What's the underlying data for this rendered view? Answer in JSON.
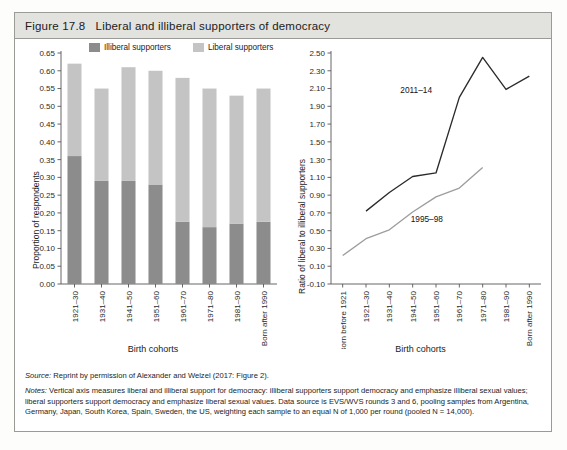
{
  "figure": {
    "number": "Figure 17.8",
    "title": "Liberal and illiberal supporters of democracy"
  },
  "colors": {
    "illiberal": "#8c8c8c",
    "liberal": "#c4c4c4",
    "line_2011_14": "#2b2b2b",
    "line_1995_98": "#9d9d9d",
    "axis": "#555555",
    "caption_bar": "#e2e2de",
    "border": "#9a9a96"
  },
  "legend": {
    "items": [
      {
        "label": "Illiberal supporters",
        "color": "#8c8c8c"
      },
      {
        "label": "Liberal supporters",
        "color": "#c4c4c4"
      }
    ]
  },
  "chart_data": [
    {
      "type": "bar",
      "id": "left-panel",
      "title": "",
      "xlabel": "Birth cohorts",
      "ylabel": "Proportion of respondents",
      "stacked": true,
      "ylim": [
        0.0,
        0.65
      ],
      "ytick_step": 0.05,
      "ytick_labels": [
        "0.00",
        "0.05",
        "0.10",
        "0.15",
        "0.20",
        "0.25",
        "0.30",
        "0.35",
        "0.40",
        "0.45",
        "0.50",
        "0.55",
        "0.60",
        "0.65"
      ],
      "grid": false,
      "legend_position": "top",
      "categories": [
        "1921–30",
        "1931–40",
        "1941–50",
        "1951–60",
        "1961–70",
        "1971–80",
        "1981–90",
        "Born after 1990"
      ],
      "series": [
        {
          "name": "Illiberal supporters",
          "color": "#8c8c8c",
          "values": [
            0.36,
            0.29,
            0.29,
            0.28,
            0.175,
            0.16,
            0.17,
            0.175
          ]
        },
        {
          "name": "Liberal supporters",
          "color": "#c4c4c4",
          "values": [
            0.26,
            0.26,
            0.32,
            0.32,
            0.405,
            0.39,
            0.36,
            0.375
          ]
        }
      ],
      "totals": [
        0.62,
        0.55,
        0.61,
        0.6,
        0.58,
        0.55,
        0.53,
        0.55
      ]
    },
    {
      "type": "line",
      "id": "right-panel",
      "title": "",
      "xlabel": "Birth cohorts",
      "ylabel": "Ratio of liberal to illiberal supporters",
      "ylim": [
        -0.1,
        2.5
      ],
      "ytick_step": 0.2,
      "ytick_labels": [
        "-0.10",
        "0.10",
        "0.30",
        "0.50",
        "0.70",
        "0.90",
        "1.10",
        "1.30",
        "1.50",
        "1.70",
        "1.90",
        "2.10",
        "2.30",
        "2.50"
      ],
      "grid": false,
      "legend_position": "inline-annotation",
      "categories": [
        "Born before 1921",
        "1921–30",
        "1931–40",
        "1941–50",
        "1951–60",
        "1961–70",
        "1971–80",
        "1981–90",
        "Born after 1990"
      ],
      "series": [
        {
          "name": "2011–14",
          "color": "#2b2b2b",
          "annotation": "2011–14",
          "x": [
            "1921–30",
            "1931–40",
            "1941–50",
            "1951–60",
            "1961–70",
            "1971–80",
            "1981–90"
          ],
          "values": [
            0.72,
            0.93,
            1.11,
            1.15,
            2.0,
            2.45,
            2.09
          ],
          "values_full": [
            null,
            0.72,
            0.93,
            1.11,
            1.15,
            2.0,
            2.45,
            2.09,
            2.24
          ]
        },
        {
          "name": "1995–98",
          "color": "#9d9d9d",
          "annotation": "1995–98",
          "x": [
            "Born before 1921",
            "1921–30",
            "1931–40",
            "1941–50",
            "1951–60",
            "1961–70",
            "1971–80"
          ],
          "values": [
            0.22,
            0.41,
            0.51,
            0.71,
            0.88,
            0.98,
            1.21
          ],
          "values_full": [
            0.22,
            0.41,
            0.51,
            0.71,
            0.88,
            0.98,
            1.21,
            null,
            null
          ]
        }
      ]
    }
  ],
  "footnotes": {
    "source_label": "Source:",
    "source_text": " Reprint by permission of Alexander and Welzel (2017: Figure 2).",
    "notes_label": "Notes:",
    "notes_text": " Vertical axis measures liberal and illiberal support for democracy: illiberal supporters support democracy and emphasize illiberal sexual values; liberal supporters support democracy and emphasize liberal sexual values. Data source is EVS/WVS rounds 3 and 6, pooling samples from Argentina, Germany, Japan, South Korea, Spain, Sweden, the US, weighting each sample to an equal N of 1,000 per round (pooled N = 14,000)."
  }
}
